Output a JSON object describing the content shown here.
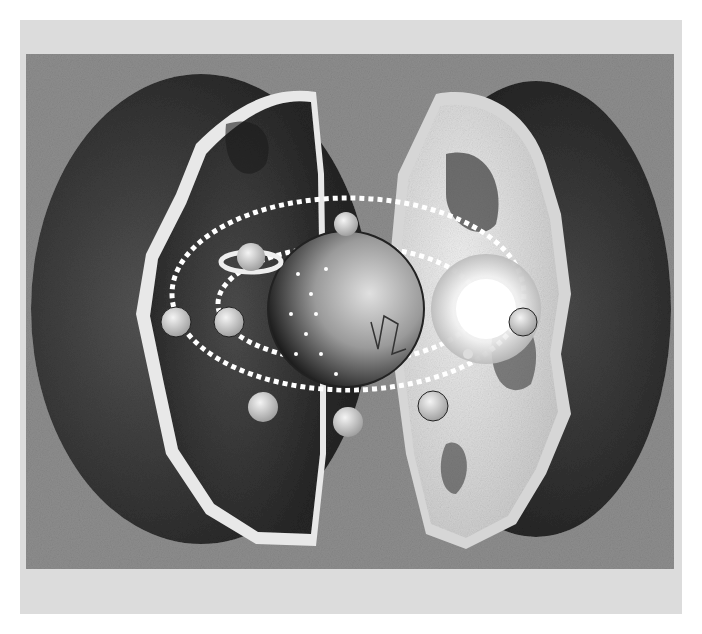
{
  "image": {
    "description": "Grayscale engraving-style illustration of a hollow Earth split into two halves, revealing a nested celestial sphere with dotted orbits, planets, Saturn, a radiant sun and a starry globe at the center.",
    "elements": [
      "left-earth-half",
      "right-earth-half",
      "central-star-globe",
      "saturn",
      "sun",
      "planets",
      "dotted-orbits"
    ],
    "colors": {
      "border": "#dcdcdc",
      "background": "#8e8e8e",
      "shell_dark": "#2a2a2a",
      "shell_light": "#e4e4e4",
      "planet": "#d8d8d8"
    }
  }
}
